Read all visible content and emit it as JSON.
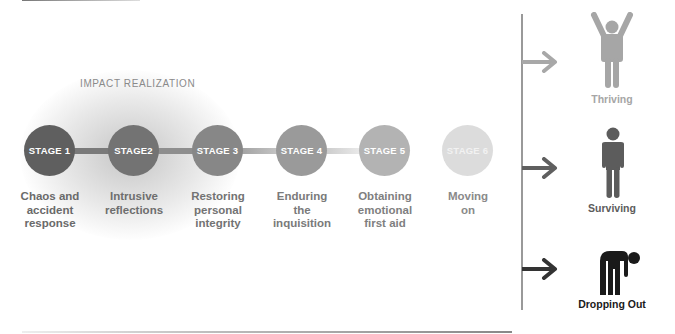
{
  "phase": {
    "label": "IMPACT REALIZATION"
  },
  "stages": [
    {
      "label": "STAGE 1",
      "description": [
        "Chaos and",
        "accident",
        "response"
      ],
      "color": "#5f5f5f",
      "text_color": "#6a6a6a"
    },
    {
      "label": "STAGE2",
      "description": [
        "Intrusive",
        "reflections"
      ],
      "color": "#737373",
      "text_color": "#6e6e6e"
    },
    {
      "label": "STAGE 3",
      "description": [
        "Restoring",
        "personal",
        "integrity"
      ],
      "color": "#878787",
      "text_color": "#737373"
    },
    {
      "label": "STAGE 4",
      "description": [
        "Enduring",
        "the",
        "inquisition"
      ],
      "color": "#9a9a9a",
      "text_color": "#7a7a7a"
    },
    {
      "label": "STAGE 5",
      "description": [
        "Obtaining",
        "emotional",
        "first aid"
      ],
      "color": "#b3b3b3",
      "text_color": "#7f7f7f"
    },
    {
      "label": "STAGE 6",
      "description": [
        "Moving",
        "on"
      ],
      "color": "#d9d9d9",
      "text_color": "#8a8a8a"
    }
  ],
  "outcomes": [
    {
      "label": "Thriving",
      "icon": "person-arms-raised-icon",
      "color": "#a6a6a6"
    },
    {
      "label": "Surviving",
      "icon": "person-standing-icon",
      "color": "#5c5c5c"
    },
    {
      "label": "Dropping Out",
      "icon": "person-bent-over-icon",
      "color": "#1a1a1a"
    }
  ]
}
